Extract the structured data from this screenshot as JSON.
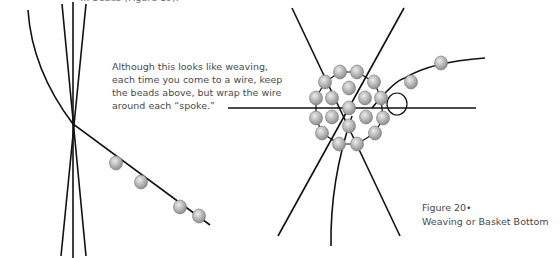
{
  "cut_off_top_text": "… beads (Figure 19).",
  "note": {
    "lines": [
      "Although this looks like weaving,",
      "each time you come to a wire, keep",
      "the beads above, but wrap the wire",
      "around each “spoke.”"
    ]
  },
  "caption": {
    "figure_label": "Figure 20•",
    "title": "Weaving or Basket Bottom"
  },
  "colors": {
    "wire": "#111111",
    "bead_fill": "#b0b0b0",
    "bead_highlight": "#e6e6e6",
    "text": "#4a4a4a"
  }
}
